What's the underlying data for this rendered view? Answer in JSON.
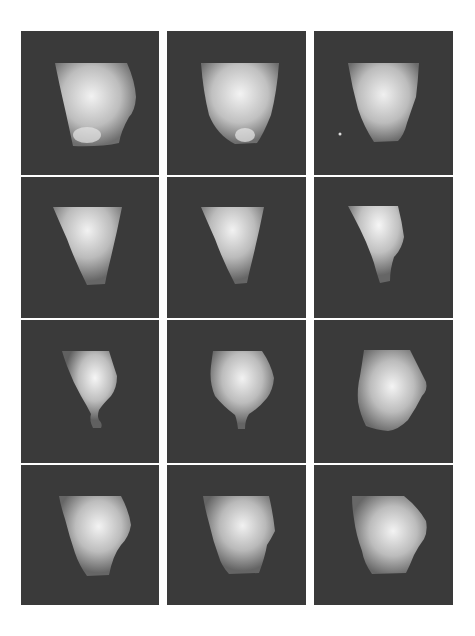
{
  "figure": {
    "background_color": "#ffffff",
    "panel_color": "#3a3a3a",
    "highlight_color": "#f4f4f4",
    "shadow_color": "#6a6a6a",
    "rows": 4,
    "cols": 3,
    "panels": [
      {
        "row": 0,
        "col": 0,
        "shape": "barrel-bulge-right",
        "label": "frame-1"
      },
      {
        "row": 0,
        "col": 1,
        "shape": "cup-rounded",
        "label": "frame-2"
      },
      {
        "row": 0,
        "col": 2,
        "shape": "cup-rounded-narrow",
        "label": "frame-3"
      },
      {
        "row": 1,
        "col": 0,
        "shape": "cone",
        "label": "frame-4"
      },
      {
        "row": 1,
        "col": 1,
        "shape": "cone",
        "label": "frame-5"
      },
      {
        "row": 1,
        "col": 2,
        "shape": "cone-bent-narrow",
        "label": "frame-6"
      },
      {
        "row": 2,
        "col": 0,
        "shape": "narrow-with-tail",
        "label": "frame-7"
      },
      {
        "row": 2,
        "col": 1,
        "shape": "bulb-with-stem",
        "label": "frame-8"
      },
      {
        "row": 2,
        "col": 2,
        "shape": "wide-barrel",
        "label": "frame-9"
      },
      {
        "row": 3,
        "col": 0,
        "shape": "barrel",
        "label": "frame-10"
      },
      {
        "row": 3,
        "col": 1,
        "shape": "barrel-bulge-right",
        "label": "frame-11"
      },
      {
        "row": 3,
        "col": 2,
        "shape": "wide-barrel",
        "label": "frame-12"
      }
    ]
  }
}
